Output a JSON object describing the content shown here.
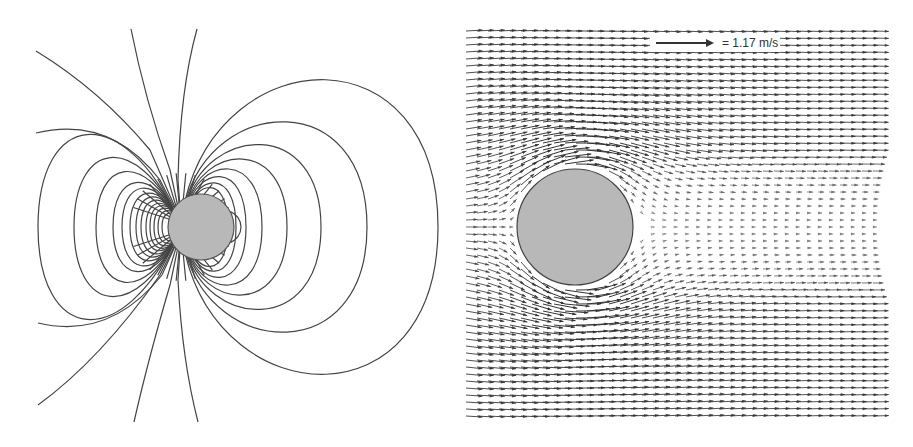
{
  "figure": {
    "left_panel": {
      "description": "Dipole-like field/streamlines around a circular obstacle",
      "circle": {
        "cx": 201,
        "cy": 227,
        "r": 33,
        "fill": "#b8b8b8",
        "stroke": "#555555"
      },
      "line_color": "#444444"
    },
    "right_panel": {
      "description": "Velocity vector field around a circular obstacle",
      "circle": {
        "cx": 115,
        "cy": 227,
        "r": 58,
        "fill": "#b8b8b8",
        "stroke": "#444444"
      },
      "region": {
        "x0": 6,
        "y0": 28,
        "x1": 427,
        "y1": 420
      },
      "arrow_color": "#333333",
      "legend": {
        "reference_speed": 1.17,
        "unit": "m/s",
        "label": "= 1.17 m/s"
      }
    }
  },
  "chart_data": {
    "type": "vector-field",
    "panels": [
      {
        "name": "field-lines",
        "obstacle": "circle"
      },
      {
        "name": "velocity-vectors",
        "obstacle": "circle",
        "reference_vector": {
          "value": 1.17,
          "unit": "m/s"
        }
      }
    ]
  }
}
